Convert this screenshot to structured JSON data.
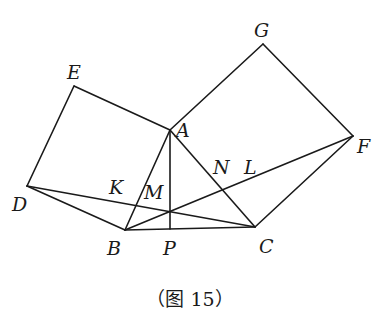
{
  "caption": "（图 15）",
  "stroke_color": "#1a1a1a",
  "points": {
    "A": {
      "label": "A",
      "x": 170,
      "y": 130,
      "lx": 176,
      "ly": 137
    },
    "B": {
      "label": "B",
      "x": 125,
      "y": 230,
      "lx": 107,
      "ly": 255
    },
    "C": {
      "label": "C",
      "x": 255,
      "y": 227,
      "lx": 259,
      "ly": 253
    },
    "D": {
      "label": "D",
      "x": 27,
      "y": 186,
      "lx": 12,
      "ly": 211
    },
    "E": {
      "label": "E",
      "x": 74,
      "y": 86,
      "lx": 67,
      "ly": 79
    },
    "F": {
      "label": "F",
      "x": 353,
      "y": 136,
      "lx": 357,
      "ly": 153
    },
    "G": {
      "label": "G",
      "x": 263,
      "y": 44,
      "lx": 254,
      "ly": 37
    },
    "K": {
      "label": "K",
      "x": 136,
      "y": 206,
      "lx": 109,
      "ly": 194
    },
    "M": {
      "label": "M",
      "x": 170,
      "y": 212,
      "lx": 144,
      "ly": 199
    },
    "N": {
      "label": "N",
      "x": 223,
      "y": 188,
      "lx": 213,
      "ly": 174
    },
    "L": {
      "label": "L",
      "x": 250,
      "y": 170,
      "lx": 244,
      "ly": 174
    },
    "P": {
      "label": "P",
      "x": 170,
      "y": 229,
      "lx": 163,
      "ly": 255
    }
  },
  "segments": [
    [
      "A",
      "B"
    ],
    [
      "B",
      "C"
    ],
    [
      "C",
      "A"
    ],
    [
      "A",
      "E"
    ],
    [
      "E",
      "D"
    ],
    [
      "D",
      "B"
    ],
    [
      "A",
      "G"
    ],
    [
      "G",
      "F"
    ],
    [
      "F",
      "C"
    ],
    [
      "D",
      "C"
    ],
    [
      "B",
      "F"
    ],
    [
      "A",
      "P"
    ]
  ]
}
